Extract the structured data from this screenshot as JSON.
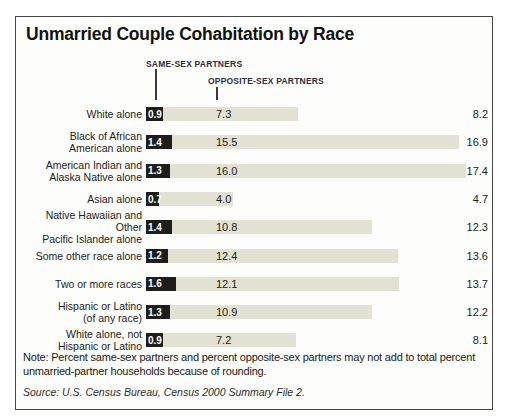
{
  "title": "Unmarried Couple Cohabitation by Race",
  "legend": {
    "same_sex_label": "SAME-SEX PARTNERS",
    "opposite_sex_label": "OPPOSITE-SEX PARTNERS"
  },
  "colors": {
    "same_sex_bar": "#1d1d1b",
    "opposite_sex_bar": "#e2e1d3",
    "frame_border": "#474747",
    "legend_text": "#2e2e40"
  },
  "chart_data": {
    "type": "bar",
    "orientation": "horizontal",
    "stacked": true,
    "unit": "percent of households",
    "title": "Unmarried Couple Cohabitation by Race",
    "categories": [
      "White alone",
      "Black of African American alone",
      "American Indian and Alaska Native alone",
      "Asian alone",
      "Native Hawaiian and Other Pacific Islander alone",
      "Some other race alone",
      "Two or more races",
      "Hispanic or Latino (of any race)",
      "White alone, not Hispanic or Latino"
    ],
    "series": [
      {
        "name": "Same-sex partners",
        "color": "#1d1d1b",
        "values": [
          0.9,
          1.4,
          1.3,
          0.7,
          1.4,
          1.2,
          1.6,
          1.3,
          0.9
        ]
      },
      {
        "name": "Opposite-sex partners",
        "color": "#e2e1d3",
        "values": [
          7.3,
          15.5,
          16.0,
          4.0,
          10.8,
          12.4,
          12.1,
          10.9,
          7.2
        ]
      }
    ],
    "totals": [
      8.2,
      16.9,
      17.4,
      4.7,
      12.3,
      13.6,
      13.7,
      12.2,
      8.1
    ],
    "xlim": [
      0,
      18
    ],
    "grid": false,
    "legend_position": "top"
  },
  "rows": [
    {
      "line1": "White alone",
      "line2": "",
      "ss": "0.9",
      "os": "7.3",
      "total": "8.2"
    },
    {
      "line1": "Black of African",
      "line2": "American alone",
      "ss": "1.4",
      "os": "15.5",
      "total": "16.9"
    },
    {
      "line1": "American Indian and",
      "line2": "Alaska Native alone",
      "ss": "1.3",
      "os": "16.0",
      "total": "17.4"
    },
    {
      "line1": "Asian alone",
      "line2": "",
      "ss": "0.7",
      "os": "4.0",
      "total": "4.7"
    },
    {
      "line1": "Native Hawaiian and Other",
      "line2": "Pacific Islander alone",
      "ss": "1.4",
      "os": "10.8",
      "total": "12.3"
    },
    {
      "line1": "Some other race alone",
      "line2": "",
      "ss": "1.2",
      "os": "12.4",
      "total": "13.6"
    },
    {
      "line1": "Two or more races",
      "line2": "",
      "ss": "1.6",
      "os": "12.1",
      "total": "13.7"
    },
    {
      "line1": "Hispanic or Latino",
      "line2": "(of any race)",
      "ss": "1.3",
      "os": "10.9",
      "total": "12.2"
    },
    {
      "line1": "White alone, not",
      "line2": "Hispanic or Latino",
      "ss": "0.9",
      "os": "7.2",
      "total": "8.1"
    }
  ],
  "note": "Note: Percent same-sex partners and percent opposite-sex partners may not add to total percent unmarried-partner households because of rounding.",
  "source": "Source: U.S. Census Bureau, Census 2000 Summary File 2."
}
